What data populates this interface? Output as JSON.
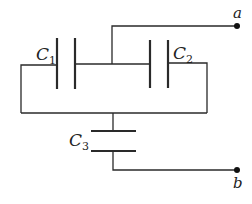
{
  "diagram": {
    "type": "capacitor-circuit",
    "colors": {
      "wire": "#2a2a2a",
      "terminal": "#111111",
      "background": "#ffffff"
    },
    "capacitors": [
      {
        "id": "C1",
        "letter": "C",
        "subscript": "1"
      },
      {
        "id": "C2",
        "letter": "C",
        "subscript": "2"
      },
      {
        "id": "C3",
        "letter": "C",
        "subscript": "3"
      }
    ],
    "terminals": [
      {
        "id": "a",
        "label": "a"
      },
      {
        "id": "b",
        "label": "b"
      }
    ]
  }
}
